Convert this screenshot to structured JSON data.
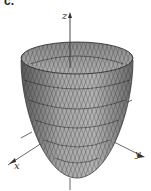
{
  "figure": {
    "part_label": "c.",
    "surface": "paraboloid",
    "axes": {
      "x_label": "x",
      "y_label": "y",
      "z_label": "z"
    },
    "colors": {
      "surface_fill": "#9a9a9a",
      "surface_dark": "#5a5a5a",
      "mesh_lines": "#2a2a2a",
      "axis": "#444444",
      "background": "#ffffff"
    }
  }
}
